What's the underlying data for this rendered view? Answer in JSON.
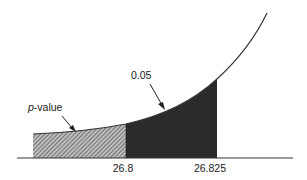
{
  "diagram": {
    "labels": {
      "p_value": "p-value",
      "p_value_italic": "p",
      "p_value_rest": "-value",
      "alpha": "0.05"
    },
    "axis_ticks": [
      "26.8",
      "26.825"
    ],
    "regions": [
      {
        "name": "p-value region",
        "fill": "hatched",
        "from": "left",
        "to": "26.8"
      },
      {
        "name": "alpha region",
        "fill": "dark",
        "from": "26.8",
        "to": "26.825"
      }
    ],
    "colors": {
      "curve": "#333333",
      "dark_fill": "#2b2b2b",
      "hatch": "#555555",
      "axis": "#333333"
    }
  }
}
